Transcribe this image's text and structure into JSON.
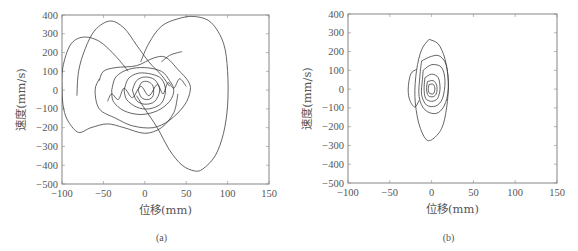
{
  "chart_data": [
    {
      "id": "a",
      "type": "line",
      "title": "",
      "caption": "(a)",
      "xlabel": "位移(mm)",
      "ylabel": "速度(mm/s)",
      "xlim": [
        -100,
        150
      ],
      "ylim": [
        -500,
        400
      ],
      "xticks": [
        -100,
        -50,
        0,
        50,
        100,
        150
      ],
      "yticks": [
        400,
        300,
        200,
        100,
        0,
        -100,
        -200,
        -300,
        -400,
        -500
      ],
      "grid": false,
      "legend": null,
      "box": {
        "left": 62,
        "right": 269,
        "top": 15,
        "bottom": 184
      },
      "series": [
        {
          "name": "phase trajectory (large right loop)",
          "points": [
            [
              -5,
              150
            ],
            [
              5,
              250
            ],
            [
              20,
              340
            ],
            [
              40,
              380
            ],
            [
              60,
              392
            ],
            [
              80,
              360
            ],
            [
              95,
              250
            ],
            [
              100,
              100
            ],
            [
              100,
              -80
            ],
            [
              95,
              -230
            ],
            [
              85,
              -350
            ],
            [
              70,
              -420
            ],
            [
              60,
              -430
            ],
            [
              45,
              -400
            ],
            [
              30,
              -320
            ],
            [
              15,
              -200
            ],
            [
              0,
              -100
            ],
            [
              -10,
              -30
            ]
          ]
        },
        {
          "name": "phase trajectory (left loop)",
          "points": [
            [
              -20,
              100
            ],
            [
              -35,
              180
            ],
            [
              -55,
              260
            ],
            [
              -75,
              282
            ],
            [
              -90,
              240
            ],
            [
              -99,
              120
            ],
            [
              -100,
              0
            ],
            [
              -98,
              -100
            ],
            [
              -92,
              -170
            ],
            [
              -80,
              -225
            ],
            [
              -65,
              -200
            ],
            [
              -45,
              -180
            ],
            [
              -25,
              -200
            ],
            [
              0,
              -230
            ],
            [
              20,
              -200
            ],
            [
              35,
              -120
            ],
            [
              40,
              -20
            ]
          ]
        },
        {
          "name": "phase trajectory (upper arc)",
          "points": [
            [
              -82,
              -30
            ],
            [
              -80,
              100
            ],
            [
              -72,
              220
            ],
            [
              -60,
              320
            ],
            [
              -42,
              368
            ],
            [
              -25,
              330
            ],
            [
              -10,
              240
            ],
            [
              5,
              150
            ],
            [
              20,
              80
            ],
            [
              30,
              20
            ]
          ]
        },
        {
          "name": "phase trajectory (mid loops)",
          "points": [
            [
              -55,
              50
            ],
            [
              -50,
              100
            ],
            [
              -35,
              120
            ],
            [
              -10,
              130
            ],
            [
              10,
              170
            ],
            [
              25,
              175
            ],
            [
              40,
              110
            ],
            [
              52,
              50
            ],
            [
              55,
              0
            ],
            [
              48,
              -80
            ],
            [
              30,
              -160
            ],
            [
              10,
              -200
            ],
            [
              -15,
              -190
            ],
            [
              -35,
              -150
            ],
            [
              -55,
              -100
            ],
            [
              -60,
              0
            ],
            [
              -55,
              60
            ]
          ]
        },
        {
          "name": "phase trajectory (inner loops 1)",
          "points": [
            [
              -40,
              0
            ],
            [
              -35,
              70
            ],
            [
              -20,
              110
            ],
            [
              0,
              120
            ],
            [
              20,
              100
            ],
            [
              30,
              50
            ],
            [
              35,
              0
            ],
            [
              30,
              -60
            ],
            [
              15,
              -110
            ],
            [
              -5,
              -130
            ],
            [
              -25,
              -110
            ],
            [
              -38,
              -60
            ],
            [
              -40,
              0
            ]
          ]
        },
        {
          "name": "phase trajectory (inner loops 2)",
          "points": [
            [
              -25,
              0
            ],
            [
              -20,
              60
            ],
            [
              -8,
              90
            ],
            [
              8,
              85
            ],
            [
              20,
              60
            ],
            [
              25,
              0
            ],
            [
              20,
              -70
            ],
            [
              5,
              -100
            ],
            [
              -10,
              -90
            ],
            [
              -22,
              -50
            ],
            [
              -25,
              0
            ]
          ]
        },
        {
          "name": "phase trajectory (inner loops 3)",
          "points": [
            [
              -15,
              0
            ],
            [
              -10,
              50
            ],
            [
              0,
              70
            ],
            [
              12,
              55
            ],
            [
              18,
              0
            ],
            [
              12,
              -60
            ],
            [
              0,
              -75
            ],
            [
              -10,
              -55
            ],
            [
              -15,
              0
            ]
          ]
        },
        {
          "name": "phase trajectory (inner loops 4)",
          "points": [
            [
              -8,
              0
            ],
            [
              -4,
              40
            ],
            [
              4,
              45
            ],
            [
              10,
              20
            ],
            [
              10,
              -30
            ],
            [
              4,
              -50
            ],
            [
              -4,
              -40
            ],
            [
              -8,
              0
            ]
          ]
        },
        {
          "name": "phase trajectory (tail)",
          "points": [
            [
              20,
              150
            ],
            [
              30,
              185
            ],
            [
              40,
              200
            ],
            [
              45,
              205
            ]
          ]
        },
        {
          "name": "phase trajectory (wiggle)",
          "points": [
            [
              -45,
              -60
            ],
            [
              -40,
              -20
            ],
            [
              -32,
              -50
            ],
            [
              -25,
              10
            ],
            [
              -15,
              -40
            ],
            [
              -5,
              20
            ],
            [
              5,
              -30
            ],
            [
              15,
              30
            ],
            [
              22,
              -20
            ],
            [
              28,
              40
            ],
            [
              35,
              10
            ],
            [
              42,
              60
            ],
            [
              50,
              20
            ]
          ]
        }
      ]
    },
    {
      "id": "b",
      "type": "line",
      "title": "",
      "caption": "(b)",
      "xlabel": "位移(mm)",
      "ylabel": "速度(mm/s)",
      "xlim": [
        -100,
        150
      ],
      "ylim": [
        -500,
        400
      ],
      "xticks": [
        -100,
        -50,
        0,
        50,
        100,
        150
      ],
      "yticks": [
        400,
        300,
        200,
        100,
        0,
        -100,
        -200,
        -300,
        -400,
        -500
      ],
      "grid": false,
      "legend": null,
      "box": {
        "left": 348,
        "right": 557,
        "top": 14,
        "bottom": 183
      },
      "series": [
        {
          "name": "phase trajectory (outer loop)",
          "points": [
            [
              -3,
              265
            ],
            [
              8,
              240
            ],
            [
              16,
              160
            ],
            [
              20,
              40
            ],
            [
              18,
              -100
            ],
            [
              12,
              -210
            ],
            [
              0,
              -270
            ],
            [
              -8,
              -260
            ],
            [
              -16,
              -170
            ],
            [
              -20,
              -40
            ],
            [
              -18,
              100
            ],
            [
              -12,
              210
            ],
            [
              -3,
              265
            ]
          ]
        },
        {
          "name": "phase trajectory (left lobe)",
          "points": [
            [
              -18,
              105
            ],
            [
              -25,
              80
            ],
            [
              -28,
              0
            ],
            [
              -26,
              -60
            ],
            [
              -20,
              -95
            ],
            [
              -15,
              -60
            ]
          ]
        },
        {
          "name": "phase trajectory (mid loop 1)",
          "points": [
            [
              -12,
              150
            ],
            [
              0,
              175
            ],
            [
              10,
              175
            ],
            [
              18,
              120
            ],
            [
              20,
              0
            ],
            [
              15,
              -90
            ],
            [
              5,
              -130
            ],
            [
              -8,
              -110
            ],
            [
              -15,
              -40
            ],
            [
              -14,
              70
            ],
            [
              -12,
              150
            ]
          ]
        },
        {
          "name": "phase trajectory (mid loop 2)",
          "points": [
            [
              -10,
              100
            ],
            [
              0,
              130
            ],
            [
              12,
              115
            ],
            [
              16,
              40
            ],
            [
              13,
              -50
            ],
            [
              5,
              -90
            ],
            [
              -6,
              -85
            ],
            [
              -12,
              -30
            ],
            [
              -11,
              50
            ],
            [
              -10,
              100
            ]
          ]
        },
        {
          "name": "phase trajectory (inner loops)",
          "points": [
            [
              -8,
              60
            ],
            [
              0,
              80
            ],
            [
              8,
              60
            ],
            [
              10,
              0
            ],
            [
              7,
              -50
            ],
            [
              0,
              -65
            ],
            [
              -7,
              -50
            ],
            [
              -9,
              0
            ],
            [
              -8,
              60
            ]
          ]
        },
        {
          "name": "phase trajectory (core)",
          "points": [
            [
              -5,
              40
            ],
            [
              2,
              45
            ],
            [
              6,
              20
            ],
            [
              6,
              -20
            ],
            [
              2,
              -40
            ],
            [
              -4,
              -35
            ],
            [
              -6,
              0
            ],
            [
              -5,
              40
            ]
          ]
        },
        {
          "name": "phase trajectory (core 2)",
          "points": [
            [
              -3,
              25
            ],
            [
              2,
              25
            ],
            [
              4,
              0
            ],
            [
              2,
              -25
            ],
            [
              -3,
              -20
            ],
            [
              -4,
              5
            ],
            [
              -3,
              25
            ]
          ]
        }
      ]
    }
  ]
}
